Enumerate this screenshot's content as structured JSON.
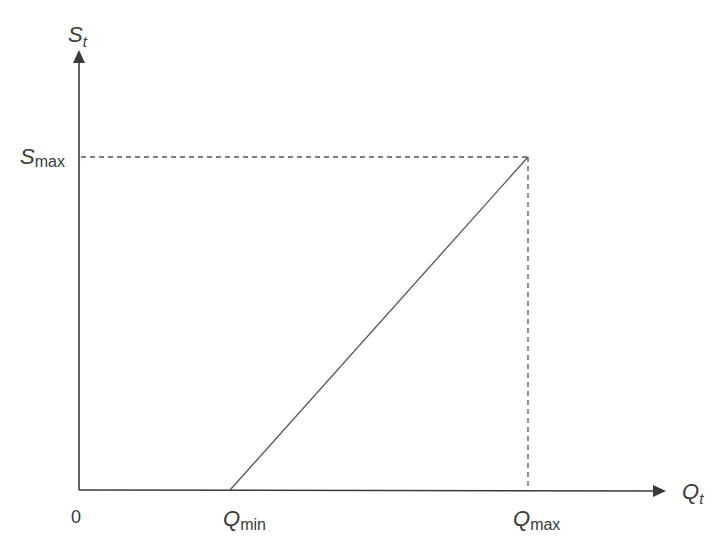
{
  "diagram": {
    "type": "piecewise-linear relationship",
    "axes": {
      "y_label": {
        "main": "S",
        "sub": "t"
      },
      "x_label": {
        "main": "Q",
        "sub": "t"
      },
      "origin_label": "0"
    },
    "ticks": {
      "s_max": {
        "main": "S",
        "sub": "max"
      },
      "q_min": {
        "main": "Q",
        "sub": "min"
      },
      "q_max": {
        "main": "Q",
        "sub": "max"
      }
    },
    "lines": [
      {
        "kind": "solid",
        "from": "(Q_min, 0)",
        "to": "(Q_max, S_max)"
      },
      {
        "kind": "dashed",
        "from": "(0, S_max)",
        "to": "(Q_max, S_max)"
      },
      {
        "kind": "dashed",
        "from": "(Q_max, 0)",
        "to": "(Q_max, S_max)"
      }
    ],
    "colors": {
      "axis": "#3a3a3a",
      "line": "#555555",
      "text": "#3a3a3a"
    }
  }
}
